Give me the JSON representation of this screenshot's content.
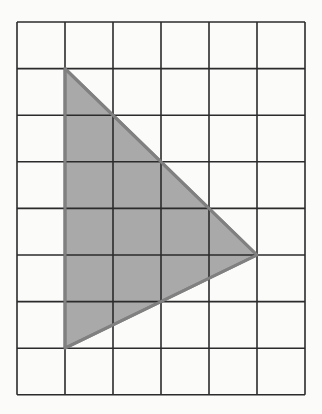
{
  "figure": {
    "grid": {
      "columns": 6,
      "rows": 8,
      "origin_px": [
        17,
        22
      ],
      "cell_w_px": 48,
      "cell_h_px": 46.6,
      "line_color": "#2b2b2b"
    },
    "triangle": {
      "vertices_grid": [
        [
          1,
          1
        ],
        [
          1,
          7
        ],
        [
          5,
          5
        ]
      ],
      "fill_color": "#a9a9a9",
      "stroke_color": "#808080"
    },
    "background_color": "#fbfbfa"
  }
}
